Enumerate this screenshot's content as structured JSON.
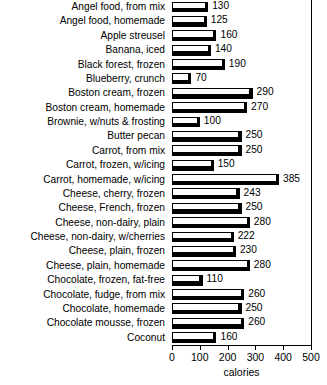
{
  "chart_data": {
    "type": "bar",
    "orientation": "horizontal",
    "title": "",
    "xlabel": "calories",
    "ylabel": "",
    "xlim": [
      0,
      500
    ],
    "xticks": [
      0,
      100,
      200,
      300,
      400,
      500
    ],
    "grid": false,
    "legend": null,
    "value_labels": true,
    "categories": [
      "Angel food, from mix",
      "Angel food, homemade",
      "Apple streusel",
      "Banana, iced",
      "Black forest, frozen",
      "Blueberry, crunch",
      "Boston cream, frozen",
      "Boston cream, homemade",
      "Brownie, w/nuts & frosting",
      "Butter pecan",
      "Carrot, from mix",
      "Carrot, frozen, w/icing",
      "Carrot, homemade, w/icing",
      "Cheese, cherry, frozen",
      "Cheese, French, frozen",
      "Cheese, non-dairy, plain",
      "Cheese, non-dairy, w/cherries",
      "Cheese, plain, frozen",
      "Cheese, plain, homemade",
      "Chocolate, frozen, fat-free",
      "Chocolate, fudge, from mix",
      "Chocolate, homemade",
      "Chocolate mousse, frozen",
      "Coconut"
    ],
    "values": [
      130,
      125,
      160,
      140,
      190,
      70,
      290,
      270,
      100,
      250,
      250,
      150,
      385,
      243,
      250,
      280,
      222,
      230,
      280,
      110,
      260,
      250,
      260,
      160
    ],
    "value_label_text": [
      "130",
      "125",
      "160",
      "140",
      "190",
      "70",
      "290",
      "270",
      "100",
      "250",
      "250",
      "150",
      "385",
      "243",
      "250",
      "280",
      "222",
      "230",
      "280",
      "110",
      "260",
      "250",
      "260",
      "160"
    ],
    "colors": {
      "bar_face": "#ffffff",
      "bar_outline": "#000000",
      "bar_shadow": "#000000",
      "axis": "#000000",
      "text": "#000000",
      "background": "#ffffff"
    }
  }
}
